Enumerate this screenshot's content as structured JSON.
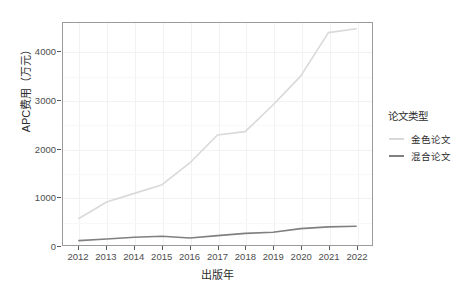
{
  "chart_data": {
    "type": "line",
    "title": "",
    "xlabel": "出版年",
    "ylabel": "APC费用（万元）",
    "legend_title": "论文类型",
    "legend_position": "right",
    "grid": true,
    "x": [
      2012,
      2013,
      2014,
      2015,
      2016,
      2017,
      2018,
      2019,
      2020,
      2021,
      2022
    ],
    "categories": [
      "2012",
      "2013",
      "2014",
      "2015",
      "2016",
      "2017",
      "2018",
      "2019",
      "2020",
      "2021",
      "2022"
    ],
    "xlim": [
      2012,
      2022
    ],
    "ylim": [
      0,
      4600
    ],
    "y_ticks": [
      0,
      1000,
      2000,
      3000,
      4000
    ],
    "y_tick_labels": [
      "0",
      "1000",
      "2000",
      "3000",
      "4000"
    ],
    "series": [
      {
        "name": "金色论文",
        "color": "#d9d9d9",
        "values": [
          550,
          890,
          1070,
          1250,
          1700,
          2280,
          2350,
          2900,
          3500,
          4400,
          4480
        ]
      },
      {
        "name": "混合论文",
        "color": "#808080",
        "values": [
          90,
          125,
          160,
          180,
          145,
          195,
          240,
          265,
          340,
          375,
          390
        ]
      }
    ]
  },
  "axes": {
    "y_title": "APC费用（万元）",
    "x_title": "出版年"
  },
  "legend": {
    "title": "论文类型",
    "items": [
      {
        "label": "金色论文",
        "color": "#d9d9d9"
      },
      {
        "label": "混合论文",
        "color": "#808080"
      }
    ]
  },
  "colors": {
    "panel_background": "#ffffff",
    "panel_border": "#9a9a9a",
    "grid": "#f2f2f2",
    "axis_text": "#4d4d4d",
    "title_text": "#2b2b2b",
    "gold_series": "#d9d9d9",
    "hybrid_series": "#808080"
  }
}
